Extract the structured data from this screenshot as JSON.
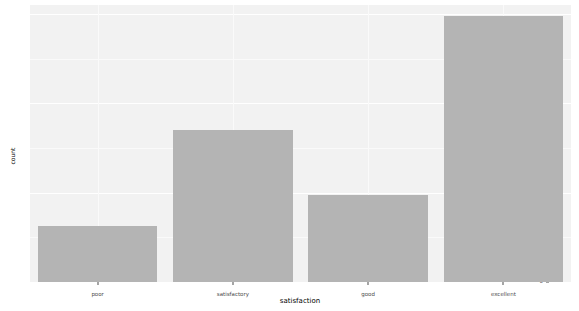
{
  "chart_data": {
    "type": "bar",
    "title": "",
    "subtitle": "",
    "xlabel": "satisfaction",
    "ylabel": "count",
    "categories": [
      "poor",
      "satisfactory",
      "good",
      "excellent"
    ],
    "values": [
      12.5,
      34,
      19.5,
      59.5
    ],
    "series": [
      {
        "name": "count",
        "values": [
          12.5,
          34,
          19.5,
          59.5
        ]
      }
    ],
    "ylim": [
      0,
      62
    ],
    "y_ticks": [
      0,
      20,
      40,
      60
    ],
    "y_tick_labels": [
      "0",
      "20",
      "40",
      "60"
    ],
    "y_minor_ticks": [
      10,
      30,
      50
    ],
    "x_tick_labels": [
      "poor",
      "satisfactory",
      "good",
      "excellent"
    ],
    "grid": true,
    "legend": false,
    "legend_position": "none",
    "annotations": [],
    "style": {
      "bar_color": "#b4b4b4",
      "panel_background": "#f2f2f2",
      "gridline_color": "#ffffff",
      "axis_text_color": "#4d4d4d",
      "axis_title_color": "#000000",
      "page_background": "#ffffff"
    }
  }
}
